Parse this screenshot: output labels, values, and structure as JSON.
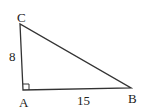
{
  "diagram": {
    "type": "right-triangle",
    "vertices": [
      {
        "name": "C",
        "label": "C",
        "x": 20,
        "y": 24
      },
      {
        "name": "A",
        "label": "A",
        "x": 23,
        "y": 90
      },
      {
        "name": "B",
        "label": "B",
        "x": 131,
        "y": 88
      }
    ],
    "sides": [
      {
        "name": "AC",
        "label": "8"
      },
      {
        "name": "AB",
        "label": "15"
      }
    ],
    "right_angle_at": "A",
    "stroke_color": "#333333"
  }
}
